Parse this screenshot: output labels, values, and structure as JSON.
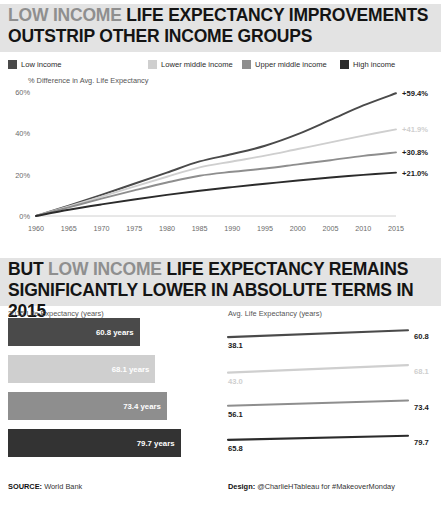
{
  "palette": {
    "low_income": "#4a4a4a",
    "lower_middle_income": "#cfcfcf",
    "upper_middle_income": "#8e8e8e",
    "high_income": "#2b2b2b",
    "band_bg": "#e3e3e3",
    "headline_grey": "#8f8f8f",
    "headline_dark": "#141414"
  },
  "header": {
    "title_grey": "LOW INCOME",
    "title_rest": "LIFE EXPECTANCY IMPROVEMENTS OUTSTRIP OTHER INCOME GROUPS"
  },
  "legend": {
    "items": [
      {
        "label": "Low income",
        "color": "#4a4a4a",
        "x": 8
      },
      {
        "label": "Lower middle income",
        "color": "#cfcfcf",
        "x": 148
      },
      {
        "label": "Upper middle income",
        "color": "#8e8e8e",
        "x": 242
      },
      {
        "label": "High income",
        "color": "#2b2b2b",
        "x": 340
      }
    ]
  },
  "mid_header": {
    "word_dark": "BUT",
    "word_grey": "LOW INCOME",
    "rest": "LIFE EXPECTANCY REMAINS SIGNIFICANTLY LOWER IN ABSOLUTE TERMS IN 2015"
  },
  "captions": {
    "top_axis_title": "% Difference in Avg. Life Expectancy",
    "bar_panel_title": "2015 Life Expectancy (years)",
    "slope_panel_title": "Avg. Life Expectancy (years)"
  },
  "footer": {
    "source_label": "SOURCE:",
    "source_value": "World Bank",
    "design_label": "Design:",
    "design_value": "@CharlieHTableau for #MakeoverMonday"
  },
  "chart_data": [
    {
      "type": "line",
      "title": "% Difference in Avg. Life Expectancy",
      "xlabel": "",
      "ylabel": "% Difference in Avg. Life Expectancy",
      "xlim": [
        1960,
        2015
      ],
      "ylim": [
        0,
        60
      ],
      "yticks": [
        "0%",
        "20%",
        "40%",
        "60%"
      ],
      "ytick_values": [
        0,
        20,
        40,
        60
      ],
      "xticks": [
        "1960",
        "1965",
        "1970",
        "1975",
        "1980",
        "1985",
        "1990",
        "1995",
        "2000",
        "2005",
        "2010",
        "2015"
      ],
      "grid": false,
      "legend_position": "top",
      "x": [
        1960,
        1965,
        1970,
        1975,
        1980,
        1985,
        1990,
        1995,
        2000,
        2005,
        2010,
        2015
      ],
      "series": [
        {
          "name": "Low income",
          "color": "#4a4a4a",
          "end_label": "+59.4%",
          "values": [
            0,
            5.0,
            10.2,
            15.6,
            21.0,
            26.4,
            30.0,
            34.0,
            39.6,
            46.5,
            53.5,
            59.4
          ]
        },
        {
          "name": "Lower middle income",
          "color": "#cfcfcf",
          "end_label": "+41.9%",
          "values": [
            0,
            4.6,
            9.4,
            14.2,
            19.0,
            23.5,
            26.4,
            29.2,
            32.4,
            35.6,
            38.9,
            41.9
          ]
        },
        {
          "name": "Upper middle income",
          "color": "#8e8e8e",
          "end_label": "+30.8%",
          "values": [
            0,
            4.2,
            8.4,
            12.4,
            16.2,
            19.5,
            21.4,
            23.0,
            25.0,
            27.0,
            29.1,
            30.8
          ]
        },
        {
          "name": "High income",
          "color": "#2b2b2b",
          "end_label": "+21.0%",
          "values": [
            0,
            3.0,
            5.6,
            8.0,
            10.2,
            12.2,
            14.0,
            15.6,
            17.2,
            18.6,
            19.9,
            21.0
          ]
        }
      ]
    },
    {
      "type": "bar",
      "title": "2015 Life Expectancy (years)",
      "orientation": "horizontal",
      "xlim": [
        0,
        85
      ],
      "categories": [
        "Low income",
        "Lower middle income",
        "Upper middle income",
        "High income"
      ],
      "values": [
        60.8,
        68.1,
        73.4,
        79.7
      ],
      "labels": [
        "60.8 years",
        "68.1 years",
        "73.4 years",
        "79.7 years"
      ],
      "colors": [
        "#4a4a4a",
        "#cfcfcf",
        "#8e8e8e",
        "#333333"
      ]
    },
    {
      "type": "line",
      "title": "Avg. Life Expectancy (years)",
      "subtype": "slope",
      "xlim": [
        1960,
        2015
      ],
      "categories": [
        "Low income",
        "Lower middle income",
        "Upper middle income",
        "High income"
      ],
      "series": [
        {
          "name": "Low income",
          "color": "#4a4a4a",
          "start": 38.1,
          "end": 60.8,
          "start_label": "38.1",
          "end_label": "60.8"
        },
        {
          "name": "Lower middle income",
          "color": "#cfcfcf",
          "start": 43.0,
          "end": 68.1,
          "start_label": "43.0",
          "end_label": "68.1"
        },
        {
          "name": "Upper middle income",
          "color": "#8e8e8e",
          "start": 56.1,
          "end": 73.4,
          "start_label": "56.1",
          "end_label": "73.4"
        },
        {
          "name": "High income",
          "color": "#2b2b2b",
          "start": 65.8,
          "end": 79.7,
          "start_label": "65.8",
          "end_label": "79.7"
        }
      ]
    }
  ]
}
